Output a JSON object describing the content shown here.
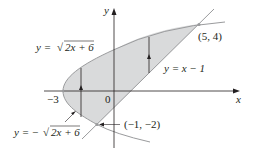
{
  "diagram": {
    "axes": {
      "x_label": "x",
      "y_label": "y",
      "origin_label": "0",
      "tick_label_neg3": "−3"
    },
    "curves": {
      "upper": {
        "label_prefix": "y = ",
        "label_body": "2x + 6",
        "label_sqrt": "√"
      },
      "lower": {
        "label_prefix": "y = −",
        "label_body": "2x + 6",
        "label_sqrt": "√"
      },
      "line": {
        "label": "y = x − 1"
      }
    },
    "points": {
      "top_intersection": "(5, 4)",
      "bottom_intersection": "(−1, −2)"
    },
    "colors": {
      "region_fill": "#d9dadb",
      "curve": "#9a9b9d",
      "axis": "#231f20",
      "text": "#231f20"
    }
  }
}
